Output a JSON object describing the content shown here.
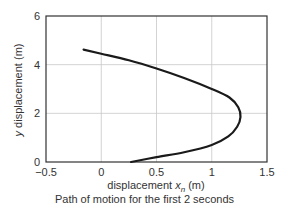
{
  "chart_data": {
    "type": "line",
    "title": "",
    "caption": "Path of motion for the first 2 seconds",
    "xlabel": "displacement x_n (m)",
    "xlabel_parts": {
      "pre": "displacement ",
      "var": "x",
      "sub": "n",
      "post": " (m)"
    },
    "ylabel": "y displacement (m)",
    "ylabel_parts": {
      "var": "y",
      "post": " displacement (m)"
    },
    "xlim": [
      -0.5,
      1.5
    ],
    "ylim": [
      0,
      6
    ],
    "xticks": [
      -0.5,
      0,
      0.5,
      1,
      1.5
    ],
    "xtick_labels": [
      "−0.5",
      "0",
      "0.5",
      "1",
      "1.5"
    ],
    "yticks": [
      0,
      2,
      4,
      6
    ],
    "ytick_labels": [
      "0",
      "2",
      "4",
      "6"
    ],
    "grid": true,
    "legend": null,
    "series": [
      {
        "name": "path",
        "color": "#1a1a1a",
        "x": [
          0.27,
          0.5,
          0.75,
          1.0,
          1.15,
          1.23,
          1.26,
          1.24,
          1.16,
          1.0,
          0.75,
          0.5,
          0.25,
          0.0,
          -0.16
        ],
        "y": [
          0.0,
          0.2,
          0.4,
          0.7,
          1.05,
          1.45,
          1.85,
          2.25,
          2.65,
          3.0,
          3.45,
          3.84,
          4.18,
          4.45,
          4.62
        ]
      }
    ]
  },
  "colors": {
    "axis": "#333333",
    "grid": "#c8c8c8",
    "line": "#1a1a1a"
  }
}
